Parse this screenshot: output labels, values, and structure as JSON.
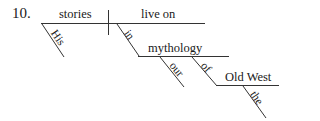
{
  "item_number": "10.",
  "diagram": {
    "subject": "stories",
    "subject_modifiers": [
      "His"
    ],
    "predicate": "live on",
    "prepositional_phrase_1": {
      "preposition": "in",
      "object": "mythology",
      "object_modifiers": [
        "our"
      ],
      "nested_phrase": {
        "preposition": "of",
        "object": "Old West",
        "object_modifiers": [
          "the"
        ]
      }
    }
  },
  "line_color": "#333333"
}
